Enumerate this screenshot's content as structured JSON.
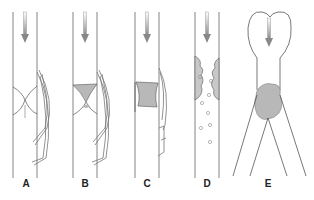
{
  "figure": {
    "panels": [
      {
        "id": "A",
        "label": "A",
        "description": "Vessel with intact valve cusps and collateral venous channels bypassing"
      },
      {
        "id": "B",
        "label": "B",
        "description": "Thrombus forming in valve pocket with collateral channels"
      },
      {
        "id": "C",
        "label": "C",
        "description": "Occlusive thrombus filling vessel segment with collateral channel"
      },
      {
        "id": "D",
        "label": "D",
        "description": "Thrombus fragmenting from vessel wall, emboli released downstream"
      },
      {
        "id": "E",
        "label": "E",
        "description": "Embolus lodged at vessel bifurcation downstream of the heart"
      }
    ],
    "colors": {
      "line": "#555555",
      "thrombus": "#b8b8b8",
      "flow_arrow": "#8a8a8a",
      "background": "#ffffff"
    },
    "flow_direction": "downward"
  }
}
